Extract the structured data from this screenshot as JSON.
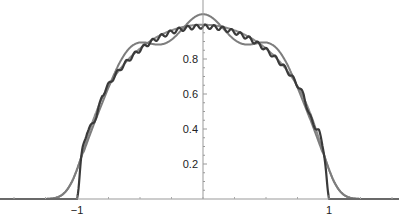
{
  "chart_data": {
    "type": "line",
    "title": "",
    "xlabel": "",
    "ylabel": "",
    "xlim": [
      -1.6,
      1.55
    ],
    "ylim": [
      0,
      1.05
    ],
    "x_ticks": [
      {
        "value": -1,
        "label": "−1"
      },
      {
        "value": 1,
        "label": "1"
      }
    ],
    "y_ticks": [
      {
        "value": 0.2,
        "label": "0.2"
      },
      {
        "value": 0.4,
        "label": "0.4"
      },
      {
        "value": 0.6,
        "label": "0.6"
      },
      {
        "value": 0.8,
        "label": "0.8"
      }
    ],
    "grid": false,
    "legend": null,
    "series": [
      {
        "name": "smooth approximation",
        "color": "#8a8a8a",
        "x": [
          -1.4,
          -1.2,
          -1.1,
          -1.0,
          -0.95,
          -0.9,
          -0.8,
          -0.6,
          -0.4,
          -0.2,
          0,
          0.2,
          0.4,
          0.6,
          0.8,
          0.9,
          0.95,
          1.0,
          1.1,
          1.2,
          1.4
        ],
        "values": [
          0.0,
          0.01,
          0.05,
          0.2,
          0.3,
          0.4,
          0.56,
          0.78,
          0.9,
          0.96,
          0.97,
          0.96,
          0.9,
          0.78,
          0.56,
          0.4,
          0.3,
          0.2,
          0.05,
          0.01,
          0.0
        ]
      },
      {
        "name": "oscillating approximation",
        "color": "#7a7a7a",
        "x": [
          -1.3,
          -1.1,
          -1.0,
          -0.9,
          -0.75,
          -0.6,
          -0.45,
          -0.3,
          -0.15,
          0,
          0.15,
          0.3,
          0.45,
          0.6,
          0.75,
          0.9,
          1.0,
          1.1,
          1.3
        ],
        "values": [
          0.0,
          0.02,
          0.12,
          0.52,
          0.75,
          0.77,
          0.95,
          0.89,
          0.99,
          1.03,
          0.99,
          0.89,
          0.95,
          0.77,
          0.75,
          0.52,
          0.12,
          0.02,
          0.0
        ]
      },
      {
        "name": "staircase approximation",
        "color": "#333333",
        "x": [
          -1.3,
          -1.0,
          -0.98,
          -0.9,
          -0.8,
          -0.6,
          -0.4,
          -0.2,
          0,
          0.2,
          0.4,
          0.6,
          0.8,
          0.9,
          0.98,
          1.0,
          1.3
        ],
        "values": [
          0.0,
          0.0,
          0.1,
          0.45,
          0.6,
          0.8,
          0.92,
          0.98,
          0.97,
          0.98,
          0.92,
          0.8,
          0.6,
          0.45,
          0.1,
          0.0,
          0.0
        ]
      }
    ]
  }
}
